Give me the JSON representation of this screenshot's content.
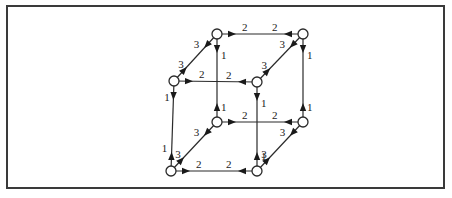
{
  "diagram": {
    "type": "weighted directed cube graph",
    "nodes": [
      {
        "id": "tbl",
        "label": "",
        "x": 217,
        "y": 34
      },
      {
        "id": "tbr",
        "label": "",
        "x": 303,
        "y": 34
      },
      {
        "id": "tfl",
        "label": "",
        "x": 174,
        "y": 81
      },
      {
        "id": "tfr",
        "label": "",
        "x": 257,
        "y": 82
      },
      {
        "id": "bbl",
        "label": "",
        "x": 217,
        "y": 122
      },
      {
        "id": "bbr",
        "label": "",
        "x": 303,
        "y": 122
      },
      {
        "id": "bfl",
        "label": "",
        "x": 171,
        "y": 171
      },
      {
        "id": "bfr",
        "label": "",
        "x": 257,
        "y": 171
      }
    ],
    "edges": [
      {
        "from": "tbl",
        "to": "tbr",
        "weight_from": "2",
        "weight_to": "2"
      },
      {
        "from": "tfl",
        "to": "tfr",
        "weight_from": "2",
        "weight_to": "2"
      },
      {
        "from": "bbl",
        "to": "bbr",
        "weight_from": "2",
        "weight_to": "2"
      },
      {
        "from": "bfl",
        "to": "bfr",
        "weight_from": "2",
        "weight_to": "2"
      },
      {
        "from": "tbl",
        "to": "bbl",
        "weight_from": "1",
        "weight_to": "1"
      },
      {
        "from": "tbr",
        "to": "bbr",
        "weight_from": "1",
        "weight_to": "1"
      },
      {
        "from": "tfl",
        "to": "bfl",
        "weight_from": "1",
        "weight_to": "1"
      },
      {
        "from": "tfr",
        "to": "bfr",
        "weight_from": "1",
        "weight_to": "1"
      },
      {
        "from": "tbl",
        "to": "tfl",
        "weight_from": "3",
        "weight_to": "3"
      },
      {
        "from": "tbr",
        "to": "tfr",
        "weight_from": "3",
        "weight_to": "3"
      },
      {
        "from": "bbl",
        "to": "bfl",
        "weight_from": "3",
        "weight_to": "3"
      },
      {
        "from": "bbr",
        "to": "bfr",
        "weight_from": "3",
        "weight_to": "3"
      }
    ],
    "weight_labels": {
      "horizontal": "2",
      "vertical": "1",
      "diagonal": "3"
    },
    "colors": {
      "stroke": "#2a2a2a",
      "node_fill": "#ffffff",
      "frame": "#3a3a3a"
    }
  }
}
